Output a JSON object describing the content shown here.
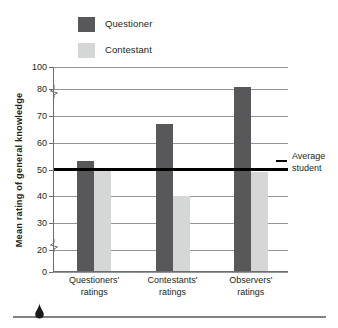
{
  "chart_data": {
    "type": "bar",
    "title": "",
    "xlabel": "",
    "ylabel": "Mean rating of general knowledge",
    "categories": [
      "Questioners' ratings",
      "Contestants' ratings",
      "Observers' ratings"
    ],
    "category_lines": [
      [
        "Questioners'",
        "ratings"
      ],
      [
        "Contestants'",
        "ratings"
      ],
      [
        "Observers'",
        "ratings"
      ]
    ],
    "series": [
      {
        "name": "Questioner",
        "color": "#58585a",
        "values": [
          53,
          67,
          82
        ]
      },
      {
        "name": "Contestant",
        "color": "#d5d6d6",
        "values": [
          50,
          40,
          49
        ]
      }
    ],
    "ylim": [
      0,
      100
    ],
    "yticks": [
      0,
      20,
      30,
      40,
      50,
      60,
      70,
      80,
      100
    ],
    "ytick_labels": [
      "0",
      "20",
      "30",
      "40",
      "50",
      "60",
      "70",
      "80",
      "100"
    ],
    "axis_breaks": [
      [
        0,
        20
      ],
      [
        80,
        100
      ]
    ],
    "grid": true,
    "legend_position": "top-left",
    "annotations": [
      {
        "name": "average-student",
        "text_lines": [
          "Average",
          "student"
        ],
        "y_value": 50,
        "line_color": "#000000"
      }
    ]
  },
  "legend": {
    "items": [
      {
        "label": "Questioner",
        "color": "#58585a"
      },
      {
        "label": "Contestant",
        "color": "#d5d6d6"
      }
    ]
  },
  "axis": {
    "y_title": "Mean rating of general knowledge",
    "tick_labels": [
      "100",
      "80",
      "70",
      "60",
      "50",
      "40",
      "30",
      "20",
      "0"
    ]
  },
  "annotation": {
    "line1": "Average",
    "line2": "student"
  },
  "ornament": {
    "shape": "teardrop"
  }
}
